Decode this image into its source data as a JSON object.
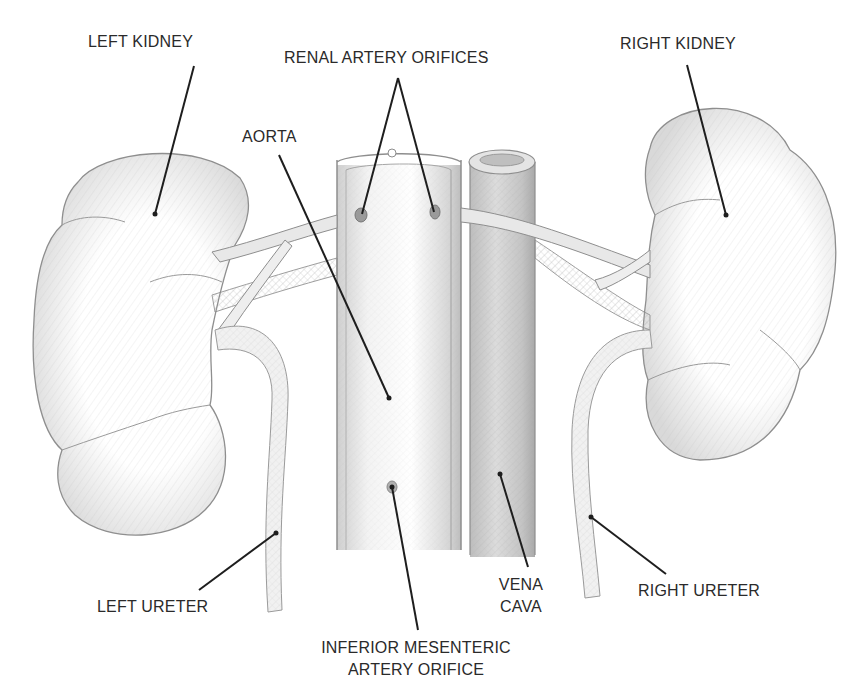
{
  "diagram": {
    "labels": {
      "left_kidney": "LEFT KIDNEY",
      "renal_artery_orifices": "RENAL ARTERY ORIFICES",
      "right_kidney": "RIGHT KIDNEY",
      "aorta": "AORTA",
      "left_ureter": "LEFT URETER",
      "vena_cava_line1": "VENA",
      "vena_cava_line2": "CAVA",
      "right_ureter": "RIGHT URETER",
      "ima_line1": "INFERIOR MESENTERIC",
      "ima_line2": "ARTERY ORIFICE"
    },
    "colors": {
      "background": "#ffffff",
      "ink": "#2a2a2a",
      "sketch": "#8a8a8a",
      "shade": "#c8c8c8"
    }
  }
}
